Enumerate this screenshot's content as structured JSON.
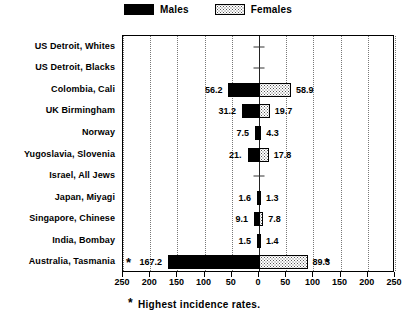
{
  "legend": {
    "items": [
      {
        "label": "Males",
        "swatch": "males-swatch-icon",
        "color": "#000000"
      },
      {
        "label": "Females",
        "swatch": "females-swatch-icon",
        "color": "#dddddd"
      }
    ]
  },
  "footnote": {
    "marker": "*",
    "text": "Highest incidence rates."
  },
  "chart_data": {
    "type": "bar",
    "orientation": "horizontal-diverging",
    "title": "",
    "xlabel": "",
    "ylabel": "",
    "xlim": [
      -250,
      250
    ],
    "xticks": [
      -250,
      -200,
      -150,
      -100,
      -50,
      0,
      50,
      100,
      150,
      200,
      250
    ],
    "xticklabels": [
      "250",
      "200",
      "150",
      "100",
      "50",
      "0",
      "50",
      "100",
      "150",
      "200",
      "250"
    ],
    "grid": true,
    "legend_position": "top-center",
    "categories": [
      "US Detroit, Whites",
      "US Detroit, Blacks",
      "Colombia, Cali",
      "UK Birmingham",
      "Norway",
      "Yugoslavia, Slovenia",
      "Israel, All Jews",
      "Japan, Miyagi",
      "Singapore, Chinese",
      "India, Bombay",
      "Australia, Tasmania"
    ],
    "series": [
      {
        "name": "Males",
        "side": "left",
        "values": [
          null,
          null,
          56.2,
          31.2,
          7.5,
          21.0,
          null,
          1.6,
          9.1,
          1.5,
          167.2
        ]
      },
      {
        "name": "Females",
        "side": "right",
        "values": [
          null,
          null,
          58.9,
          19.7,
          4.3,
          17.8,
          null,
          1.3,
          7.8,
          1.4,
          89.3
        ]
      }
    ],
    "value_labels": [
      {
        "left": "",
        "right": ""
      },
      {
        "left": "",
        "right": ""
      },
      {
        "left": "56.2",
        "right": "58.9"
      },
      {
        "left": "31.2",
        "right": "19.7"
      },
      {
        "left": "7.5",
        "right": "4.3"
      },
      {
        "left": "21.",
        "right": "17.8"
      },
      {
        "left": "",
        "right": ""
      },
      {
        "left": "1.6",
        "right": "1.3"
      },
      {
        "left": "9.1",
        "right": "7.8"
      },
      {
        "left": "1.5",
        "right": "1.4"
      },
      {
        "left": "167.2",
        "right": "89.3"
      }
    ],
    "annotations": [
      {
        "row": 10,
        "side": "left",
        "marker": "*"
      },
      {
        "row": 10,
        "side": "right",
        "marker": "*"
      }
    ]
  }
}
